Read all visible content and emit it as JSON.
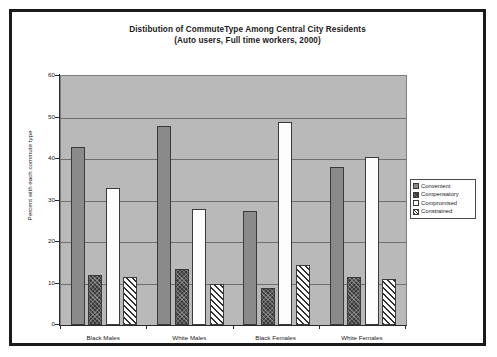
{
  "chart_data": {
    "type": "bar",
    "title": "Distibution of CommuteType Among Central City Residents",
    "subtitle": "(Auto users, Full time workers, 2000)",
    "xlabel": "",
    "ylabel": "Percent with each commute type",
    "ylim": [
      0,
      60
    ],
    "ytick_step": 10,
    "yticks": [
      0,
      10,
      20,
      30,
      40,
      50,
      60
    ],
    "grid": true,
    "legend_position": "right",
    "categories": [
      "Black Males",
      "White Males",
      "Black Females",
      "White Females"
    ],
    "series": [
      {
        "name": "Convenient",
        "values": [
          43,
          48,
          27.5,
          38
        ]
      },
      {
        "name": "Compensatory",
        "values": [
          12,
          13.5,
          9,
          11.5
        ]
      },
      {
        "name": "Compromised",
        "values": [
          33,
          28,
          49,
          40.5
        ]
      },
      {
        "name": "Constrained",
        "values": [
          11.5,
          10,
          14.5,
          11
        ]
      }
    ]
  },
  "legend": {
    "items": [
      {
        "label": "Convenient",
        "pattern": "solid-gray",
        "color": "#8a8a8a"
      },
      {
        "label": "Compensatory",
        "pattern": "crosshatch",
        "color": "#3c3c3c"
      },
      {
        "label": "Compromised",
        "pattern": "solid-white",
        "color": "#ffffff"
      },
      {
        "label": "Constrained",
        "pattern": "diagonal",
        "color": "#2f2f2f"
      }
    ]
  },
  "style": {
    "plot_background": "#b9b9b9",
    "gridline_color": "#6f6f6f",
    "axis_color": "#2a2a2a",
    "frame_color": "#1b1b1b",
    "text_color": "#1a1a1a"
  }
}
